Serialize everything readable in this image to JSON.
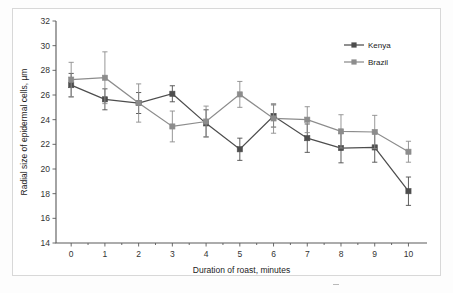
{
  "figure": {
    "background_color": "#ffffff",
    "frame_color": "#d8d8d8"
  },
  "chart_data": {
    "type": "line",
    "title": "",
    "subtitle": "",
    "xlabel": "Duration of roast, minutes",
    "ylabel": "Radial size of epidermal cells, µm",
    "x": [
      0,
      1,
      2,
      3,
      4,
      5,
      6,
      7,
      8,
      9,
      10
    ],
    "xtick_labels": [
      "0",
      "1",
      "2",
      "3",
      "4",
      "5",
      "6",
      "7",
      "8",
      "9",
      "10"
    ],
    "ytick_labels": [
      "14",
      "16",
      "18",
      "20",
      "22",
      "24",
      "26",
      "28",
      "30",
      "32"
    ],
    "xlim": [
      -0.45,
      10.55
    ],
    "ylim": [
      14,
      32
    ],
    "yticks": [
      14,
      16,
      18,
      20,
      22,
      24,
      26,
      28,
      30,
      32
    ],
    "grid": false,
    "legend_position": "top-right",
    "error_bar_type": "standard deviation",
    "series": [
      {
        "name": "Kenya",
        "color": "#4d4d4d",
        "marker": "square",
        "values": [
          26.8,
          25.65,
          25.35,
          26.1,
          23.7,
          21.6,
          24.3,
          22.5,
          21.7,
          21.75,
          18.2
        ],
        "error": [
          0.95,
          0.85,
          0.85,
          0.65,
          1.1,
          0.9,
          0.9,
          1.15,
          1.2,
          1.2,
          1.15
        ]
      },
      {
        "name": "Brazil",
        "color": "#8c8c8c",
        "marker": "square",
        "values": [
          27.25,
          27.4,
          25.35,
          23.45,
          23.85,
          26.05,
          24.1,
          24.0,
          23.05,
          23.0,
          21.4
        ],
        "error": [
          1.4,
          2.1,
          1.55,
          1.25,
          1.25,
          1.05,
          1.2,
          1.05,
          1.35,
          1.35,
          0.85
        ]
      }
    ]
  },
  "legend": {
    "entries": [
      {
        "label": "Kenya",
        "color": "#4d4d4d"
      },
      {
        "label": "Brazil",
        "color": "#8c8c8c"
      }
    ]
  }
}
